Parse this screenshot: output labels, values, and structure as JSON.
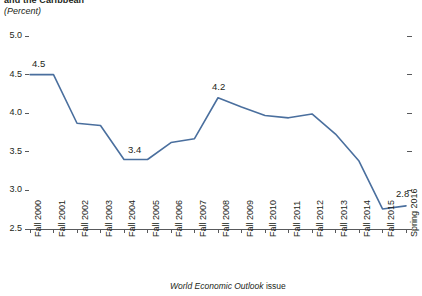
{
  "title": "and the Caribbean",
  "subtitle": "(Percent)",
  "xaxis_caption_italic": "World Economic Outlook",
  "xaxis_caption_rest": " issue",
  "colors": {
    "line": "#4a6f9e",
    "axis": "#58595b",
    "text": "#231f20"
  },
  "chart_data": {
    "type": "line",
    "title": "and the Caribbean",
    "subtitle": "(Percent)",
    "xlabel": "World Economic Outlook issue",
    "ylabel": "",
    "grid": false,
    "legend": "none",
    "ylim": [
      2.5,
      5.0
    ],
    "yticks": [
      "5.0",
      "4.5",
      "4.0",
      "3.5",
      "3.0",
      "2.5"
    ],
    "ytick_values": [
      5.0,
      4.5,
      4.0,
      3.5,
      3.0,
      2.5
    ],
    "categories": [
      "Fall 2000",
      "Fall 2001",
      "Fall 2002",
      "Fall 2003",
      "Fall 2004",
      "Fall 2005",
      "Fall 2006",
      "Fall 2007",
      "Fall 2008",
      "Fall 2009",
      "Fall 2010",
      "Fall 2011",
      "Fall 2012",
      "Fall 2013",
      "Fall 2014",
      "Fall 2015",
      "Spring 2016"
    ],
    "values": [
      4.5,
      4.5,
      3.87,
      3.84,
      3.4,
      3.4,
      3.62,
      3.67,
      4.2,
      4.08,
      3.97,
      3.94,
      3.99,
      3.73,
      3.38,
      2.76,
      2.8
    ],
    "point_labels": [
      {
        "index": 0,
        "text": "4.5"
      },
      {
        "index": 4,
        "text": "3.4"
      },
      {
        "index": 8,
        "text": "4.2"
      },
      {
        "index": 16,
        "text": "2.8"
      }
    ]
  }
}
